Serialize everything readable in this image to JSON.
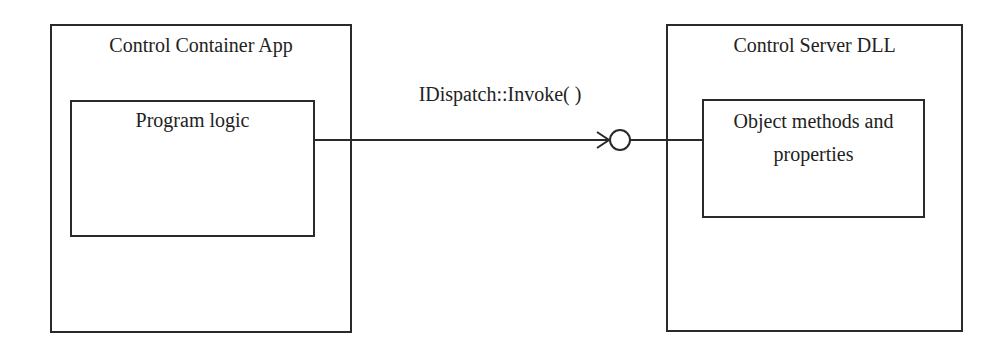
{
  "diagram": {
    "type": "component-interface",
    "containers": [
      {
        "id": "container-app",
        "title": "Control Container App",
        "inner": {
          "label": "Program logic"
        }
      },
      {
        "id": "server-dll",
        "title": "Control Server DLL",
        "inner": {
          "label_lines": [
            "Object methods and",
            "properties"
          ]
        }
      }
    ],
    "connector": {
      "label": "IDispatch::Invoke( )",
      "from": "Program logic",
      "to": "Object methods and properties",
      "style": "arrow-to-lollipop-interface"
    },
    "colors": {
      "line": "#2a2a2a",
      "background": "#ffffff",
      "text": "#222222"
    }
  }
}
